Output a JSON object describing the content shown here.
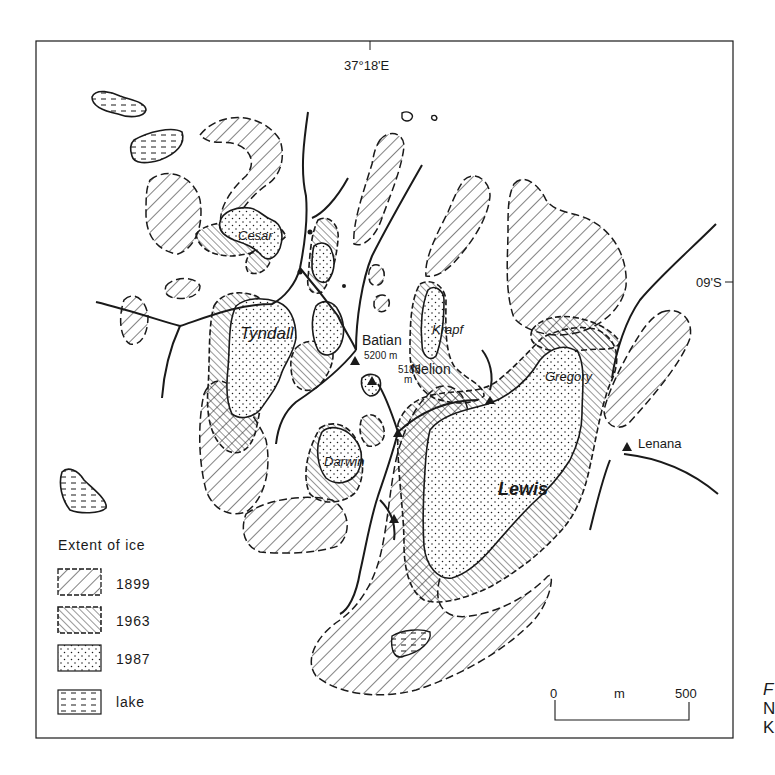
{
  "map": {
    "longitude_label": "37°18'E",
    "latitude_label": "09'S",
    "glacier_labels": {
      "cesar": "Cesar",
      "tyndall": "Tyndall",
      "darwin": "Darwin",
      "krapf": "Krapf",
      "gregory": "Gregory",
      "lewis": "Lewis"
    },
    "peaks": [
      {
        "name": "Batian",
        "elevation": "5200 m"
      },
      {
        "name": "Nelion",
        "elevation_value": "5188",
        "elevation_unit": "m"
      },
      {
        "name": "Lenana"
      }
    ]
  },
  "legend": {
    "title": "Extent of ice",
    "items": [
      {
        "label": "1899",
        "pattern": "sparse-hatch"
      },
      {
        "label": "1963",
        "pattern": "dense-hatch"
      },
      {
        "label": "1987",
        "pattern": "stipple"
      },
      {
        "label": "lake",
        "pattern": "dashes"
      }
    ]
  },
  "scale_bar": {
    "start": "0",
    "unit": "m",
    "end": "500"
  },
  "cropped_caption_letters": [
    "F",
    "N",
    "K"
  ],
  "colors": {
    "ink": "#1a1a1a",
    "paper": "#ffffff"
  }
}
